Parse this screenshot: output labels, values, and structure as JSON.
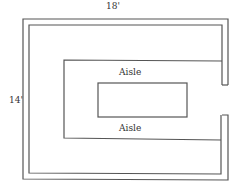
{
  "diagram": {
    "type": "floor-plan",
    "labels": {
      "width": "18'",
      "height": "14'",
      "aisle_top": "Aisle",
      "aisle_bottom": "Aisle"
    },
    "colors": {
      "line": "#555555",
      "background": "#ffffff"
    }
  }
}
